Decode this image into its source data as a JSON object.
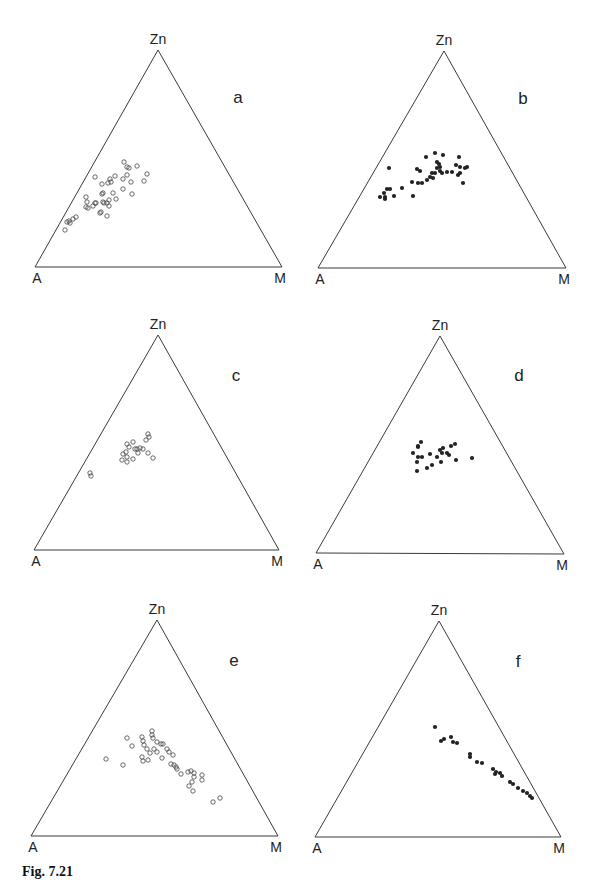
{
  "figure": {
    "caption_label": "Fig. 7.21",
    "caption_rest": "Zn–A–M ternary plots (caption truncated)",
    "line_color": "#3a3a3a",
    "point_color": "#222222"
  },
  "chart_data": [
    {
      "type": "scatter",
      "subtype": "ternary",
      "panel": "a",
      "marker": "open-circle",
      "apex_labels": {
        "top": "Zn",
        "left": "A",
        "right": "M"
      },
      "triangle_px": {
        "top": [
          158,
          50
        ],
        "left": [
          35,
          267
        ],
        "right": [
          282,
          267
        ]
      },
      "label_px": [
        238,
        98
      ],
      "points_px": [
        [
          124,
          162
        ],
        [
          127,
          167
        ],
        [
          129,
          168
        ],
        [
          137,
          166
        ],
        [
          147,
          174
        ],
        [
          144,
          181
        ],
        [
          131,
          182
        ],
        [
          123,
          179
        ],
        [
          127,
          175
        ],
        [
          115,
          176
        ],
        [
          110,
          179
        ],
        [
          111,
          182
        ],
        [
          108,
          183
        ],
        [
          102,
          184
        ],
        [
          95,
          177
        ],
        [
          103,
          193
        ],
        [
          102,
          194
        ],
        [
          113,
          193
        ],
        [
          123,
          189
        ],
        [
          132,
          194
        ],
        [
          116,
          199
        ],
        [
          109,
          200
        ],
        [
          107,
          203
        ],
        [
          104,
          203
        ],
        [
          103,
          202
        ],
        [
          96,
          203
        ],
        [
          93,
          206
        ],
        [
          88,
          208
        ],
        [
          86,
          207
        ],
        [
          86,
          197
        ],
        [
          87,
          202
        ],
        [
          95,
          203
        ],
        [
          101,
          212
        ],
        [
          100,
          213
        ],
        [
          107,
          216
        ],
        [
          109,
          206
        ],
        [
          76,
          217
        ],
        [
          73,
          219
        ],
        [
          69,
          221
        ],
        [
          67,
          222
        ],
        [
          65,
          230
        ],
        [
          70,
          223
        ]
      ]
    },
    {
      "type": "scatter",
      "subtype": "ternary",
      "panel": "b",
      "marker": "filled-circle",
      "apex_labels": {
        "top": "Zn",
        "left": "A",
        "right": "M"
      },
      "triangle_px": {
        "top": [
          444,
          51
        ],
        "left": [
          318,
          268
        ],
        "right": [
          566,
          268
        ]
      },
      "label_px": [
        523,
        99
      ],
      "points_px": [
        [
          435,
          153
        ],
        [
          443,
          155
        ],
        [
          459,
          157
        ],
        [
          426,
          157
        ],
        [
          389,
          168
        ],
        [
          417,
          169
        ],
        [
          420,
          171
        ],
        [
          437,
          162
        ],
        [
          439,
          164
        ],
        [
          440,
          167
        ],
        [
          437,
          168
        ],
        [
          440,
          171
        ],
        [
          435,
          173
        ],
        [
          432,
          173
        ],
        [
          430,
          177
        ],
        [
          433,
          178
        ],
        [
          442,
          173
        ],
        [
          447,
          172
        ],
        [
          452,
          172
        ],
        [
          456,
          165
        ],
        [
          460,
          167
        ],
        [
          465,
          168
        ],
        [
          467,
          167
        ],
        [
          460,
          173
        ],
        [
          458,
          175
        ],
        [
          463,
          183
        ],
        [
          427,
          180
        ],
        [
          422,
          183
        ],
        [
          418,
          183
        ],
        [
          412,
          182
        ],
        [
          402,
          188
        ],
        [
          413,
          196
        ],
        [
          387,
          189
        ],
        [
          390,
          189
        ],
        [
          384,
          193
        ],
        [
          380,
          197
        ],
        [
          385,
          197
        ],
        [
          385,
          199
        ],
        [
          394,
          196
        ]
      ]
    },
    {
      "type": "scatter",
      "subtype": "ternary",
      "panel": "c",
      "marker": "open-circle",
      "apex_labels": {
        "top": "Zn",
        "left": "A",
        "right": "M"
      },
      "triangle_px": {
        "top": [
          158,
          335
        ],
        "left": [
          34,
          550
        ],
        "right": [
          279,
          550
        ]
      },
      "label_px": [
        236,
        376
      ],
      "points_px": [
        [
          148,
          434
        ],
        [
          149,
          437
        ],
        [
          146,
          440
        ],
        [
          133,
          442
        ],
        [
          127,
          444
        ],
        [
          129,
          447
        ],
        [
          135,
          449
        ],
        [
          137,
          449
        ],
        [
          140,
          448
        ],
        [
          143,
          449
        ],
        [
          138,
          453
        ],
        [
          148,
          453
        ],
        [
          153,
          458
        ],
        [
          133,
          459
        ],
        [
          126,
          452
        ],
        [
          123,
          454
        ],
        [
          127,
          457
        ],
        [
          122,
          460
        ],
        [
          127,
          462
        ],
        [
          90,
          473
        ],
        [
          91,
          476
        ]
      ]
    },
    {
      "type": "scatter",
      "subtype": "ternary",
      "panel": "d",
      "marker": "filled-circle",
      "apex_labels": {
        "top": "Zn",
        "left": "A",
        "right": "M"
      },
      "triangle_px": {
        "top": [
          440,
          336
        ],
        "left": [
          316,
          553
        ],
        "right": [
          564,
          554
        ]
      },
      "label_px": [
        519,
        376
      ],
      "points_px": [
        [
          421,
          442
        ],
        [
          418,
          446
        ],
        [
          418,
          447
        ],
        [
          413,
          453
        ],
        [
          418,
          457
        ],
        [
          422,
          457
        ],
        [
          417,
          462
        ],
        [
          417,
          471
        ],
        [
          427,
          468
        ],
        [
          432,
          465
        ],
        [
          430,
          454
        ],
        [
          437,
          457
        ],
        [
          440,
          450
        ],
        [
          443,
          448
        ],
        [
          442,
          453
        ],
        [
          447,
          453
        ],
        [
          449,
          455
        ],
        [
          451,
          446
        ],
        [
          455,
          444
        ],
        [
          441,
          462
        ],
        [
          456,
          460
        ],
        [
          472,
          458
        ]
      ]
    },
    {
      "type": "scatter",
      "subtype": "ternary",
      "panel": "e",
      "marker": "open-circle",
      "apex_labels": {
        "top": "Zn",
        "left": "A",
        "right": "M"
      },
      "triangle_px": {
        "top": [
          157,
          620
        ],
        "left": [
          31,
          836
        ],
        "right": [
          278,
          836
        ]
      },
      "label_px": [
        234,
        661
      ],
      "points_px": [
        [
          106,
          759
        ],
        [
          123,
          765
        ],
        [
          127,
          738
        ],
        [
          132,
          746
        ],
        [
          142,
          737
        ],
        [
          143,
          741
        ],
        [
          144,
          745
        ],
        [
          152,
          731
        ],
        [
          152,
          735
        ],
        [
          153,
          738
        ],
        [
          157,
          742
        ],
        [
          161,
          744
        ],
        [
          163,
          744
        ],
        [
          147,
          749
        ],
        [
          150,
          753
        ],
        [
          154,
          749
        ],
        [
          157,
          752
        ],
        [
          167,
          749
        ],
        [
          169,
          752
        ],
        [
          173,
          755
        ],
        [
          142,
          757
        ],
        [
          143,
          761
        ],
        [
          148,
          760
        ],
        [
          162,
          758
        ],
        [
          171,
          764
        ],
        [
          174,
          765
        ],
        [
          176,
          767
        ],
        [
          177,
          769
        ],
        [
          181,
          774
        ],
        [
          188,
          772
        ],
        [
          191,
          771
        ],
        [
          194,
          773
        ],
        [
          194,
          777
        ],
        [
          192,
          782
        ],
        [
          189,
          786
        ],
        [
          193,
          791
        ],
        [
          202,
          775
        ],
        [
          202,
          780
        ],
        [
          213,
          802
        ],
        [
          220,
          798
        ]
      ]
    },
    {
      "type": "scatter",
      "subtype": "ternary",
      "panel": "f",
      "marker": "filled-circle",
      "apex_labels": {
        "top": "Zn",
        "left": "A",
        "right": "M"
      },
      "triangle_px": {
        "top": [
          439,
          621
        ],
        "left": [
          315,
          837
        ],
        "right": [
          561,
          837
        ]
      },
      "label_px": [
        518,
        662
      ],
      "points_px": [
        [
          435,
          727
        ],
        [
          441,
          741
        ],
        [
          444,
          739
        ],
        [
          451,
          737
        ],
        [
          453,
          742
        ],
        [
          457,
          743
        ],
        [
          470,
          754
        ],
        [
          470,
          757
        ],
        [
          477,
          762
        ],
        [
          482,
          763
        ],
        [
          493,
          769
        ],
        [
          496,
          772
        ],
        [
          500,
          773
        ],
        [
          502,
          776
        ],
        [
          495,
          774
        ],
        [
          510,
          782
        ],
        [
          513,
          784
        ],
        [
          518,
          788
        ],
        [
          523,
          791
        ],
        [
          527,
          793
        ],
        [
          530,
          796
        ],
        [
          532,
          798
        ]
      ]
    }
  ]
}
